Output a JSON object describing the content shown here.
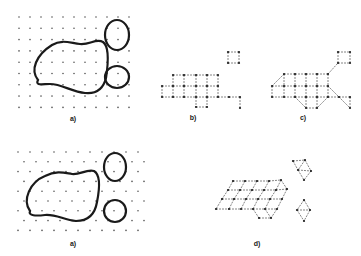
{
  "figure": {
    "background": "#ffffff",
    "ink_color": "#1a1a1a",
    "dot_color": "#555555",
    "edge_color": "#666666"
  },
  "panels": [
    {
      "id": "a-top",
      "label": "a)",
      "label_pos": [
        73,
        118
      ],
      "kind": "square-lattice-with-regions",
      "lattice": {
        "x0": 19,
        "y0": 17,
        "dx": 11,
        "dy": 11.3,
        "cols": 11,
        "rows": 9
      },
      "regions": [
        {
          "name": "large-blob",
          "path": "M 38 80 C 30 70, 36 55, 52 45 C 62 39, 70 43, 80 44 C 90 45, 96 38, 103 42 C 110 47, 108 65, 106 78 C 103 90, 95 94, 85 93 C 72 92, 62 84, 50 84 C 42 84, 35 86, 38 80 Z"
        },
        {
          "name": "upper-small-blob",
          "cx": 117,
          "cy": 35,
          "rx": 12,
          "ry": 15
        },
        {
          "name": "lower-small-blob",
          "cx": 117,
          "cy": 77,
          "rx": 12,
          "ry": 11
        }
      ]
    },
    {
      "id": "b",
      "label": "b)",
      "label_pos": [
        193,
        117
      ],
      "kind": "graph",
      "nodes": [
        [
          173,
          75
        ],
        [
          184,
          75
        ],
        [
          196,
          75
        ],
        [
          207,
          75
        ],
        [
          218,
          75
        ],
        [
          162,
          86
        ],
        [
          173,
          86
        ],
        [
          184,
          86
        ],
        [
          196,
          86
        ],
        [
          207,
          86
        ],
        [
          218,
          86
        ],
        [
          162,
          97
        ],
        [
          173,
          97
        ],
        [
          184,
          97
        ],
        [
          196,
          97
        ],
        [
          207,
          97
        ],
        [
          218,
          97
        ],
        [
          229,
          97
        ],
        [
          240,
          97
        ],
        [
          196,
          107
        ],
        [
          207,
          107
        ],
        [
          240,
          108
        ],
        [
          228,
          52
        ],
        [
          239,
          52
        ],
        [
          228,
          63
        ],
        [
          239,
          63
        ]
      ],
      "edges": [
        [
          0,
          1
        ],
        [
          1,
          2
        ],
        [
          2,
          3
        ],
        [
          3,
          4
        ],
        [
          5,
          6
        ],
        [
          6,
          7
        ],
        [
          7,
          8
        ],
        [
          8,
          9
        ],
        [
          9,
          10
        ],
        [
          11,
          12
        ],
        [
          12,
          13
        ],
        [
          13,
          14
        ],
        [
          14,
          15
        ],
        [
          15,
          16
        ],
        [
          16,
          17
        ],
        [
          17,
          18
        ],
        [
          0,
          6
        ],
        [
          1,
          7
        ],
        [
          2,
          8
        ],
        [
          3,
          9
        ],
        [
          4,
          10
        ],
        [
          5,
          11
        ],
        [
          6,
          12
        ],
        [
          7,
          13
        ],
        [
          8,
          14
        ],
        [
          9,
          15
        ],
        [
          10,
          16
        ],
        [
          14,
          19
        ],
        [
          15,
          20
        ],
        [
          19,
          20
        ],
        [
          18,
          21
        ],
        [
          22,
          23
        ],
        [
          22,
          24
        ],
        [
          23,
          25
        ],
        [
          24,
          25
        ]
      ]
    },
    {
      "id": "c",
      "label": "c)",
      "label_pos": [
        303,
        117
      ],
      "kind": "graph",
      "nodes": [
        [
          284,
          74
        ],
        [
          295,
          74
        ],
        [
          306,
          74
        ],
        [
          317,
          74
        ],
        [
          328,
          74
        ],
        [
          272,
          86
        ],
        [
          284,
          86
        ],
        [
          295,
          86
        ],
        [
          306,
          86
        ],
        [
          317,
          86
        ],
        [
          328,
          86
        ],
        [
          272,
          97
        ],
        [
          284,
          97
        ],
        [
          295,
          97
        ],
        [
          306,
          97
        ],
        [
          317,
          97
        ],
        [
          328,
          97
        ],
        [
          339,
          97
        ],
        [
          350,
          97
        ],
        [
          306,
          108
        ],
        [
          317,
          108
        ],
        [
          350,
          108
        ],
        [
          338,
          52
        ],
        [
          350,
          52
        ],
        [
          338,
          63
        ],
        [
          350,
          63
        ]
      ],
      "edges": [
        [
          0,
          1
        ],
        [
          1,
          2
        ],
        [
          2,
          3
        ],
        [
          3,
          4
        ],
        [
          5,
          6
        ],
        [
          6,
          7
        ],
        [
          7,
          8
        ],
        [
          8,
          9
        ],
        [
          9,
          10
        ],
        [
          11,
          12
        ],
        [
          12,
          13
        ],
        [
          13,
          14
        ],
        [
          14,
          15
        ],
        [
          15,
          16
        ],
        [
          16,
          17
        ],
        [
          17,
          18
        ],
        [
          0,
          5
        ],
        [
          0,
          6
        ],
        [
          1,
          7
        ],
        [
          2,
          8
        ],
        [
          3,
          9
        ],
        [
          4,
          10
        ],
        [
          5,
          11
        ],
        [
          6,
          12
        ],
        [
          7,
          13
        ],
        [
          8,
          14
        ],
        [
          9,
          15
        ],
        [
          10,
          16
        ],
        [
          13,
          19
        ],
        [
          14,
          19
        ],
        [
          15,
          20
        ],
        [
          16,
          20
        ],
        [
          19,
          20
        ],
        [
          10,
          17
        ],
        [
          17,
          21
        ],
        [
          18,
          21
        ],
        [
          4,
          24
        ],
        [
          22,
          23
        ],
        [
          22,
          24
        ],
        [
          23,
          25
        ],
        [
          24,
          25
        ]
      ]
    },
    {
      "id": "a-bottom",
      "label": "a)",
      "label_pos": [
        73,
        243
      ],
      "kind": "hex-lattice-with-regions",
      "lattice": {
        "x0": 18,
        "y0": 152,
        "dx": 12,
        "dy": 9.8,
        "cols": 11,
        "rows": 9,
        "offset": 6
      },
      "regions": [
        {
          "name": "large-blob",
          "path": "M 30 211 C 22 200, 30 182, 45 176 C 57 170, 65 173, 72 174 C 80 175, 86 169, 94 171 C 101 175, 99 192, 97 202 C 95 214, 88 221, 76 221 C 64 220, 56 214, 45 215 C 36 216, 28 216, 30 211 Z"
        },
        {
          "name": "upper-small-blob",
          "cx": 115,
          "cy": 167,
          "rx": 11,
          "ry": 14
        },
        {
          "name": "lower-small-blob",
          "cx": 115,
          "cy": 211,
          "rx": 11,
          "ry": 11
        }
      ]
    },
    {
      "id": "d",
      "label": "d)",
      "label_pos": [
        257,
        243
      ],
      "kind": "graph",
      "nodes": [
        [
          233,
          181
        ],
        [
          245,
          181
        ],
        [
          257,
          181
        ],
        [
          269,
          181
        ],
        [
          281,
          180
        ],
        [
          228,
          190
        ],
        [
          240,
          190
        ],
        [
          252,
          190
        ],
        [
          264,
          190
        ],
        [
          276,
          190
        ],
        [
          287,
          189
        ],
        [
          222,
          199
        ],
        [
          234,
          199
        ],
        [
          246,
          199
        ],
        [
          258,
          199
        ],
        [
          270,
          199
        ],
        [
          282,
          199
        ],
        [
          216,
          209
        ],
        [
          229,
          209
        ],
        [
          241,
          209
        ],
        [
          253,
          209
        ],
        [
          265,
          209
        ],
        [
          277,
          209
        ],
        [
          259,
          218
        ],
        [
          271,
          218
        ],
        [
          293,
          161
        ],
        [
          305,
          160
        ],
        [
          298,
          170
        ],
        [
          311,
          171
        ],
        [
          304,
          180
        ],
        [
          304,
          200
        ],
        [
          297,
          210
        ],
        [
          310,
          210
        ],
        [
          304,
          221
        ]
      ],
      "edges": [
        [
          0,
          1
        ],
        [
          1,
          2
        ],
        [
          2,
          3
        ],
        [
          3,
          4
        ],
        [
          5,
          6
        ],
        [
          6,
          7
        ],
        [
          7,
          8
        ],
        [
          8,
          9
        ],
        [
          9,
          10
        ],
        [
          11,
          12
        ],
        [
          12,
          13
        ],
        [
          13,
          14
        ],
        [
          14,
          15
        ],
        [
          15,
          16
        ],
        [
          17,
          18
        ],
        [
          18,
          19
        ],
        [
          19,
          20
        ],
        [
          20,
          21
        ],
        [
          21,
          22
        ],
        [
          0,
          5
        ],
        [
          1,
          6
        ],
        [
          2,
          7
        ],
        [
          3,
          8
        ],
        [
          4,
          9
        ],
        [
          4,
          10
        ],
        [
          5,
          11
        ],
        [
          6,
          12
        ],
        [
          7,
          13
        ],
        [
          8,
          14
        ],
        [
          9,
          15
        ],
        [
          10,
          16
        ],
        [
          11,
          17
        ],
        [
          12,
          18
        ],
        [
          13,
          19
        ],
        [
          14,
          20
        ],
        [
          15,
          21
        ],
        [
          16,
          22
        ],
        [
          20,
          23
        ],
        [
          21,
          24
        ],
        [
          23,
          24
        ],
        [
          22,
          24
        ],
        [
          25,
          26
        ],
        [
          25,
          27
        ],
        [
          26,
          27
        ],
        [
          26,
          28
        ],
        [
          27,
          28
        ],
        [
          27,
          29
        ],
        [
          28,
          29
        ],
        [
          30,
          31
        ],
        [
          30,
          32
        ],
        [
          31,
          32
        ],
        [
          31,
          33
        ],
        [
          32,
          33
        ]
      ]
    }
  ]
}
